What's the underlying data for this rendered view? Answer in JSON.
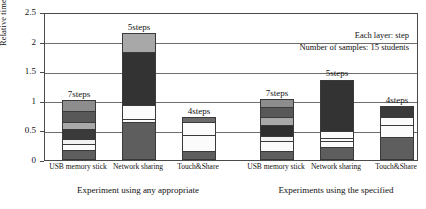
{
  "chart_data": {
    "type": "bar",
    "stacked": true,
    "title": "",
    "xlabel": "",
    "ylabel": "Relative time taken",
    "ylim": [
      0,
      2.5
    ],
    "yticks": [
      "0",
      "0.5",
      "1",
      "1.5",
      "2",
      "2.5"
    ],
    "grid": true,
    "categories": [
      "USB memory stick",
      "Network sharing",
      "Touch&Share",
      "USB memory stick",
      "Network sharing",
      "Touch&Share"
    ],
    "groups": [
      {
        "caption": "Experiment using any appropriate",
        "categories": [
          0,
          1,
          2
        ]
      },
      {
        "caption": "Experiments using the specified",
        "categories": [
          3,
          4,
          5
        ]
      }
    ],
    "annotations": [
      {
        "bar": 0,
        "text": "7steps"
      },
      {
        "bar": 1,
        "text": "5steps"
      },
      {
        "bar": 2,
        "text": "4steps"
      },
      {
        "bar": 3,
        "text": "7steps"
      },
      {
        "bar": 4,
        "text": "5steps"
      },
      {
        "bar": 5,
        "text": "4steps"
      }
    ],
    "legend_position": "top-right",
    "legend_notes": [
      "Each layer: step",
      "Number of samples: 15 students"
    ],
    "bars": [
      {
        "name": "USB memory stick (any appropriate)",
        "total": 1.02,
        "steps": 7,
        "layers": [
          {
            "value": 0.15,
            "color": "#5e5e5e"
          },
          {
            "value": 0.12,
            "color": "#fbfbfb"
          },
          {
            "value": 0.08,
            "color": "#f2f2f2"
          },
          {
            "value": 0.17,
            "color": "#3a3a3a"
          },
          {
            "value": 0.13,
            "color": "#a8a8a8"
          },
          {
            "value": 0.19,
            "color": "#585858"
          },
          {
            "value": 0.18,
            "color": "#8d8d8d"
          }
        ]
      },
      {
        "name": "Network sharing (any appropriate)",
        "total": 2.15,
        "steps": 5,
        "layers": [
          {
            "value": 0.63,
            "color": "#5e5e5e"
          },
          {
            "value": 0.06,
            "color": "#fbfbfb"
          },
          {
            "value": 0.23,
            "color": "#fbfbfb"
          },
          {
            "value": 0.92,
            "color": "#333333"
          },
          {
            "value": 0.31,
            "color": "#a8a8a8"
          }
        ]
      },
      {
        "name": "Touch&Share (any appropriate)",
        "total": 0.72,
        "steps": 4,
        "layers": [
          {
            "value": 0.14,
            "color": "#5e5e5e"
          },
          {
            "value": 0.29,
            "color": "#fbfbfb"
          },
          {
            "value": 0.23,
            "color": "#fbfbfb"
          },
          {
            "value": 0.06,
            "color": "#6b6b6b"
          }
        ]
      },
      {
        "name": "USB memory stick (specified)",
        "total": 1.03,
        "steps": 7,
        "layers": [
          {
            "value": 0.14,
            "color": "#5e5e5e"
          },
          {
            "value": 0.18,
            "color": "#fbfbfb"
          },
          {
            "value": 0.09,
            "color": "#f2f2f2"
          },
          {
            "value": 0.19,
            "color": "#2e2e2e"
          },
          {
            "value": 0.14,
            "color": "#a8a8a8"
          },
          {
            "value": 0.17,
            "color": "#585858"
          },
          {
            "value": 0.12,
            "color": "#8d8d8d"
          }
        ]
      },
      {
        "name": "Network sharing (specified)",
        "total": 1.36,
        "steps": 5,
        "layers": [
          {
            "value": 0.2,
            "color": "#5e5e5e"
          },
          {
            "value": 0.11,
            "color": "#fbfbfb"
          },
          {
            "value": 0.05,
            "color": "#fbfbfb"
          },
          {
            "value": 0.12,
            "color": "#fbfbfb"
          },
          {
            "value": 0.88,
            "color": "#333333"
          }
        ]
      },
      {
        "name": "Touch&Share (specified)",
        "total": 0.92,
        "steps": 4,
        "layers": [
          {
            "value": 0.38,
            "color": "#5e5e5e"
          },
          {
            "value": 0.22,
            "color": "#fbfbfb"
          },
          {
            "value": 0.13,
            "color": "#fbfbfb"
          },
          {
            "value": 0.19,
            "color": "#3a3a3a"
          }
        ]
      }
    ]
  }
}
